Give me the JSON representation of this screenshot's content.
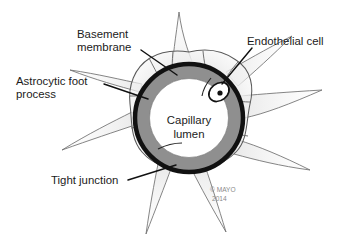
{
  "figure": {
    "background_color": "#ffffff"
  },
  "labels": {
    "basement_membrane": {
      "line1": "Basement",
      "line2": "membrane"
    },
    "endothelial_cell": {
      "line1": "Endothelial cell"
    },
    "astrocytic_foot_process": {
      "line1": "Astrocytic foot",
      "line2": "process"
    },
    "tight_junction": {
      "line1": "Tight junction"
    },
    "capillary_lumen": {
      "line1": "Capillary",
      "line2": "lumen"
    }
  },
  "credit": {
    "line1": "© MAYO",
    "line2": "2014"
  },
  "colors": {
    "basement_membrane_ring": "#111111",
    "endothelial_band": "#8f8f8f",
    "lumen_fill": "#ffffff",
    "astrocyte_fill": "#ebebeb",
    "astrocyte_outline": "#5a5a5a",
    "nucleus_fill": "#ffffff",
    "nucleus_dot": "#111111",
    "label_text": "#1b1b1b",
    "credit_text": "#8a8a8a",
    "leader_line": "#111111"
  },
  "geometry": {
    "capillary_center_x": 189,
    "capillary_center_y": 118,
    "basement_membrane_radius": 56,
    "endothelial_outer_radius": 52,
    "lumen_radius": 39,
    "nucleus_center_x": 219,
    "nucleus_center_y": 92,
    "astrocyte_process_count": 8
  }
}
